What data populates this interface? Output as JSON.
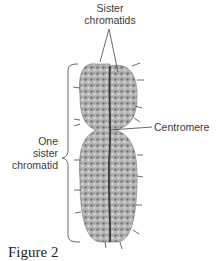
{
  "labels": {
    "sister_chromatids_line1": "Sister",
    "sister_chromatids_line2": "chromatids",
    "centromere": "Centromere",
    "one_sister_chromatid_line1": "One",
    "one_sister_chromatid_line2": "sister",
    "one_sister_chromatid_line3": "chromatid"
  },
  "caption": "Figure 2",
  "colors": {
    "chromatid_fill": "#9a9a9a",
    "chromatid_dark": "#555555",
    "line": "#444444"
  }
}
